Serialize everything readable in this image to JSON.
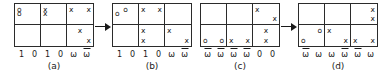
{
  "figure": {
    "caption_prefix": "",
    "panels": [
      {
        "id": "a",
        "caption": "(a)",
        "grid": {
          "columns": 3,
          "rows": 2,
          "cells": [
            {
              "pos": "r1c1",
              "marks": [
                {
                  "text": "o",
                  "anchor": "tl"
                },
                {
                  "text": "o",
                  "anchor": "ml"
                }
              ]
            },
            {
              "pos": "r1c2",
              "marks": [
                {
                  "text": "x",
                  "anchor": "tl"
                },
                {
                  "text": "x",
                  "anchor": "ml"
                }
              ]
            },
            {
              "pos": "r1c3",
              "marks": [
                {
                  "text": "x",
                  "anchor": "tl"
                },
                {
                  "text": "x",
                  "anchor": "tr"
                }
              ]
            },
            {
              "pos": "r2c1",
              "marks": []
            },
            {
              "pos": "r2c2",
              "marks": []
            },
            {
              "pos": "r2c3",
              "marks": [
                {
                  "text": "x",
                  "anchor": "tc"
                },
                {
                  "text": "x",
                  "anchor": "br"
                }
              ]
            }
          ]
        },
        "axis_labels": [
          {
            "text": "1",
            "bar": false
          },
          {
            "text": "0",
            "bar": false
          },
          {
            "text": "1",
            "bar": false
          },
          {
            "text": "0",
            "bar": false
          },
          {
            "text": "ω",
            "bar": false
          },
          {
            "text": "ω",
            "bar": true
          }
        ]
      },
      {
        "id": "b",
        "caption": "(b)",
        "grid": {
          "columns": 3,
          "rows": 2,
          "cells": [
            {
              "pos": "r1c1",
              "marks": [
                {
                  "text": "o",
                  "anchor": "tc"
                },
                {
                  "text": "o",
                  "anchor": "ml"
                }
              ]
            },
            {
              "pos": "r1c2",
              "marks": [
                {
                  "text": "x",
                  "anchor": "tl"
                },
                {
                  "text": "x",
                  "anchor": "tr"
                }
              ]
            },
            {
              "pos": "r1c3",
              "marks": []
            },
            {
              "pos": "r2c1",
              "marks": []
            },
            {
              "pos": "r2c2",
              "marks": [
                {
                  "text": "x",
                  "anchor": "tl"
                },
                {
                  "text": "x",
                  "anchor": "bl"
                }
              ]
            },
            {
              "pos": "r2c3",
              "marks": [
                {
                  "text": "x",
                  "anchor": "tl"
                },
                {
                  "text": "x",
                  "anchor": "br"
                }
              ]
            }
          ]
        },
        "axis_labels": [
          {
            "text": "1",
            "bar": false
          },
          {
            "text": "0",
            "bar": false
          },
          {
            "text": "1",
            "bar": false
          },
          {
            "text": "0",
            "bar": false
          },
          {
            "text": "ω",
            "bar": false
          },
          {
            "text": "ω",
            "bar": true
          }
        ]
      },
      {
        "id": "c",
        "caption": "(c)",
        "grid": {
          "columns": 3,
          "rows": 2,
          "cells": [
            {
              "pos": "r1c1",
              "marks": []
            },
            {
              "pos": "r1c2",
              "marks": []
            },
            {
              "pos": "r1c3",
              "marks": [
                {
                  "text": "x",
                  "anchor": "tl"
                },
                {
                  "text": "x",
                  "anchor": "br"
                }
              ]
            },
            {
              "pos": "r2c1",
              "marks": [
                {
                  "text": "o",
                  "anchor": "bl"
                },
                {
                  "text": "o",
                  "anchor": "br"
                }
              ]
            },
            {
              "pos": "r2c2",
              "marks": [
                {
                  "text": "x",
                  "anchor": "bl"
                },
                {
                  "text": "x",
                  "anchor": "br"
                }
              ]
            },
            {
              "pos": "r2c3",
              "marks": [
                {
                  "text": "x",
                  "anchor": "tc"
                },
                {
                  "text": "x",
                  "anchor": "bc"
                }
              ]
            }
          ]
        },
        "axis_labels": [
          {
            "text": "ω",
            "bar": true
          },
          {
            "text": "ω",
            "bar": true
          },
          {
            "text": "ω",
            "bar": true
          },
          {
            "text": "ω",
            "bar": true
          },
          {
            "text": "0",
            "bar": false
          },
          {
            "text": "0",
            "bar": false
          }
        ]
      },
      {
        "id": "d",
        "caption": "(d)",
        "grid": {
          "columns": 3,
          "rows": 2,
          "cells": [
            {
              "pos": "r1c1",
              "marks": []
            },
            {
              "pos": "r1c2",
              "marks": []
            },
            {
              "pos": "r1c3",
              "marks": [
                {
                  "text": "x",
                  "anchor": "tr"
                },
                {
                  "text": "x",
                  "anchor": "br"
                }
              ]
            },
            {
              "pos": "r2c1",
              "marks": [
                {
                  "text": "o",
                  "anchor": "tr"
                },
                {
                  "text": "o",
                  "anchor": "bl"
                }
              ]
            },
            {
              "pos": "r2c2",
              "marks": [
                {
                  "text": "x",
                  "anchor": "tl"
                },
                {
                  "text": "x",
                  "anchor": "br"
                }
              ]
            },
            {
              "pos": "r2c3",
              "marks": [
                {
                  "text": "x",
                  "anchor": "bl"
                },
                {
                  "text": "x",
                  "anchor": "br"
                }
              ]
            }
          ]
        },
        "axis_labels": [
          {
            "text": "ω",
            "bar": true
          },
          {
            "text": "ω",
            "bar": false
          },
          {
            "text": "ω",
            "bar": false
          },
          {
            "text": "ω",
            "bar": true
          },
          {
            "text": "ω",
            "bar": true
          },
          {
            "text": "ω",
            "bar": false
          }
        ]
      }
    ],
    "arrows": [
      {
        "between": "a-b",
        "direction": "right"
      },
      {
        "between": "c-d",
        "direction": "right"
      }
    ],
    "colors": {
      "ink": "#1a1a1a",
      "rule": "#2b2b2b",
      "background": "#ffffff"
    }
  }
}
